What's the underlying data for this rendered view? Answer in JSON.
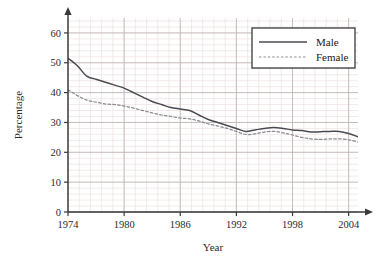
{
  "chart_data": {
    "type": "line",
    "title": "",
    "xlabel": "Year",
    "ylabel": "Percentage",
    "xlim": [
      1974,
      2005
    ],
    "ylim": [
      0,
      65
    ],
    "xticks": [
      1974,
      1980,
      1986,
      1992,
      1998,
      2004
    ],
    "yticks": [
      0,
      10,
      20,
      30,
      40,
      50,
      60
    ],
    "grid": true,
    "grid_minor": true,
    "legend_position": "top-right",
    "x": [
      1974,
      1975,
      1976,
      1977,
      1978,
      1979,
      1980,
      1981,
      1982,
      1983,
      1984,
      1985,
      1986,
      1987,
      1988,
      1989,
      1990,
      1991,
      1992,
      1993,
      1994,
      1995,
      1996,
      1997,
      1998,
      1999,
      2000,
      2001,
      2002,
      2003,
      2004,
      2005
    ],
    "series": [
      {
        "name": "Male",
        "style": "solid",
        "color": "#4a4a52",
        "values": [
          51.5,
          49.0,
          45.5,
          44.5,
          43.5,
          42.5,
          41.5,
          40.0,
          38.5,
          37.0,
          36.0,
          35.0,
          34.5,
          34.0,
          32.5,
          31.0,
          30.0,
          29.0,
          28.0,
          27.0,
          27.5,
          28.0,
          28.3,
          28.0,
          27.5,
          27.3,
          26.8,
          26.9,
          27.0,
          27.0,
          26.3,
          25.2
        ]
      },
      {
        "name": "Female",
        "style": "dashed",
        "color": "#8a8a92",
        "values": [
          41.0,
          39.0,
          37.5,
          36.8,
          36.2,
          36.0,
          35.5,
          34.8,
          34.0,
          33.2,
          32.5,
          32.0,
          31.5,
          31.2,
          30.5,
          29.5,
          28.8,
          28.0,
          27.0,
          26.0,
          26.2,
          26.8,
          27.0,
          26.5,
          25.8,
          25.0,
          24.5,
          24.3,
          24.5,
          24.5,
          24.2,
          23.4
        ]
      }
    ]
  },
  "legend": {
    "items": [
      {
        "label": "Male",
        "swatch": "solid-line-swatch"
      },
      {
        "label": "Female",
        "swatch": "dashed-line-swatch"
      }
    ]
  },
  "axes": {
    "y_title": "Percentage",
    "x_title": "Year",
    "y_tick_labels": [
      "0",
      "10",
      "20",
      "30",
      "40",
      "50",
      "60"
    ],
    "x_tick_labels": [
      "1974",
      "1980",
      "1986",
      "1992",
      "1998",
      "2004"
    ]
  },
  "colors": {
    "male_line": "#4a4a52",
    "female_line": "#8a8a92",
    "grid_minor": "#e9dcdc",
    "grid_major": "#bdb2b2",
    "axis": "#3a3a3a",
    "text": "#2b2b2b",
    "legend_border": "#3a3a3a",
    "legend_background": "#ffffff",
    "plot_background": "#ffffff"
  }
}
